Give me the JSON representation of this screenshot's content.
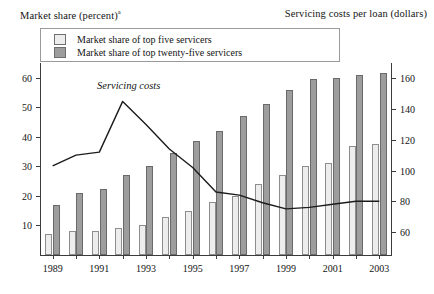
{
  "left_axis_title": "Market share (percent)",
  "left_axis_title_sup": "a",
  "right_axis_title": "Servicing costs per loan (dollars)",
  "legend": {
    "items": [
      {
        "label": "Market share of top five servicers",
        "color": "#ededed",
        "key": "five"
      },
      {
        "label": "Market share of top twenty-five servicers",
        "color": "#9d9d9d",
        "key": "twentyfive"
      }
    ]
  },
  "annotation": {
    "text": "Servicing costs",
    "x": 1992,
    "y_right": 156
  },
  "chart_data": {
    "type": "bar",
    "title": "",
    "subtitle": "",
    "xlabel": "",
    "ylabel": "Market share (percent)",
    "y2label": "Servicing costs per loan (dollars)",
    "grid": false,
    "legend_position": "top-left",
    "categories": [
      1989,
      1990,
      1991,
      1992,
      1993,
      1994,
      1995,
      1996,
      1997,
      1998,
      1999,
      2000,
      2001,
      2002,
      2003
    ],
    "tick_labels_x": [
      "1989",
      "1991",
      "1993",
      "1995",
      "1997",
      "1999",
      "2001",
      "2003"
    ],
    "ylim": [
      0,
      65
    ],
    "yticks": [
      10,
      20,
      30,
      40,
      50,
      60
    ],
    "y2lim": [
      45,
      170
    ],
    "y2ticks": [
      60,
      80,
      100,
      120,
      140,
      160
    ],
    "series": [
      {
        "name": "Market share of top five servicers",
        "type": "bar",
        "axis": "left",
        "color": "#ededed",
        "values": [
          7,
          8,
          8,
          9,
          10,
          13,
          15,
          18,
          20,
          24,
          27,
          30,
          31,
          37,
          37.5
        ]
      },
      {
        "name": "Market share of top twenty-five servicers",
        "type": "bar",
        "axis": "left",
        "color": "#9d9d9d",
        "values": [
          17,
          21,
          22.5,
          27,
          30,
          34.5,
          38.5,
          42,
          47,
          51,
          56,
          59.5,
          60,
          61,
          61.5
        ]
      },
      {
        "name": "Servicing costs",
        "type": "line",
        "axis": "right",
        "color": "#1c1c1c",
        "values": [
          103,
          110,
          112,
          145,
          130,
          114,
          102,
          86,
          84,
          79,
          75,
          76,
          78,
          80,
          80
        ]
      }
    ]
  }
}
